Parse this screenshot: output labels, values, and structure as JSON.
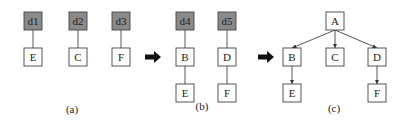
{
  "colors": {
    "shaded": "#8a8a8a",
    "plain": "#ffffff",
    "stroke": "#444444",
    "text": "#222222"
  },
  "box_size": 18,
  "panels": [
    {
      "label": "(a)",
      "label_x": 72,
      "label_y": 113,
      "nodes": [
        {
          "id": "a_d1",
          "text": "d1",
          "x": 24,
          "y": 12,
          "shaded": true
        },
        {
          "id": "a_E",
          "text": "E",
          "x": 24,
          "y": 48,
          "shaded": false
        },
        {
          "id": "a_d2",
          "text": "d2",
          "x": 69,
          "y": 12,
          "shaded": true
        },
        {
          "id": "a_C",
          "text": "C",
          "x": 69,
          "y": 48,
          "shaded": false
        },
        {
          "id": "a_d3",
          "text": "d3",
          "x": 112,
          "y": 12,
          "shaded": true
        },
        {
          "id": "a_F",
          "text": "F",
          "x": 112,
          "y": 48,
          "shaded": false
        }
      ],
      "edges": [
        {
          "from": "a_d1",
          "to": "a_E",
          "arrow": false
        },
        {
          "from": "a_d2",
          "to": "a_C",
          "arrow": false
        },
        {
          "from": "a_d3",
          "to": "a_F",
          "arrow": false
        }
      ]
    },
    {
      "label": "(b)",
      "label_x": 202,
      "label_y": 110,
      "nodes": [
        {
          "id": "b_d4",
          "text": "d4",
          "x": 176,
          "y": 12,
          "shaded": true
        },
        {
          "id": "b_B",
          "text": "B",
          "x": 176,
          "y": 48,
          "shaded": false
        },
        {
          "id": "b_E",
          "text": "E",
          "x": 176,
          "y": 84,
          "shaded": false
        },
        {
          "id": "b_d5",
          "text": "d5",
          "x": 218,
          "y": 12,
          "shaded": true
        },
        {
          "id": "b_D",
          "text": "D",
          "x": 218,
          "y": 48,
          "shaded": false
        },
        {
          "id": "b_F",
          "text": "F",
          "x": 218,
          "y": 84,
          "shaded": false
        }
      ],
      "edges": [
        {
          "from": "b_d4",
          "to": "b_B",
          "arrow": false
        },
        {
          "from": "b_B",
          "to": "b_E",
          "arrow": false
        },
        {
          "from": "b_d5",
          "to": "b_D",
          "arrow": false
        },
        {
          "from": "b_D",
          "to": "b_F",
          "arrow": false
        }
      ]
    },
    {
      "label": "(c)",
      "label_x": 334,
      "label_y": 112,
      "nodes": [
        {
          "id": "c_A",
          "text": "A",
          "x": 326,
          "y": 12,
          "shaded": false
        },
        {
          "id": "c_B",
          "text": "B",
          "x": 283,
          "y": 48,
          "shaded": false
        },
        {
          "id": "c_C",
          "text": "C",
          "x": 326,
          "y": 48,
          "shaded": false
        },
        {
          "id": "c_D",
          "text": "D",
          "x": 368,
          "y": 48,
          "shaded": false
        },
        {
          "id": "c_E",
          "text": "E",
          "x": 283,
          "y": 84,
          "shaded": false
        },
        {
          "id": "c_F",
          "text": "F",
          "x": 368,
          "y": 84,
          "shaded": false
        }
      ],
      "edges": [
        {
          "from": "c_A",
          "to": "c_B",
          "arrow": true
        },
        {
          "from": "c_A",
          "to": "c_C",
          "arrow": true
        },
        {
          "from": "c_A",
          "to": "c_D",
          "arrow": true
        },
        {
          "from": "c_B",
          "to": "c_E",
          "arrow": true
        },
        {
          "from": "c_D",
          "to": "c_F",
          "arrow": true
        }
      ]
    }
  ],
  "transition_arrows": [
    {
      "x": 145,
      "y": 57,
      "w": 16
    },
    {
      "x": 258,
      "y": 57,
      "w": 16
    }
  ]
}
